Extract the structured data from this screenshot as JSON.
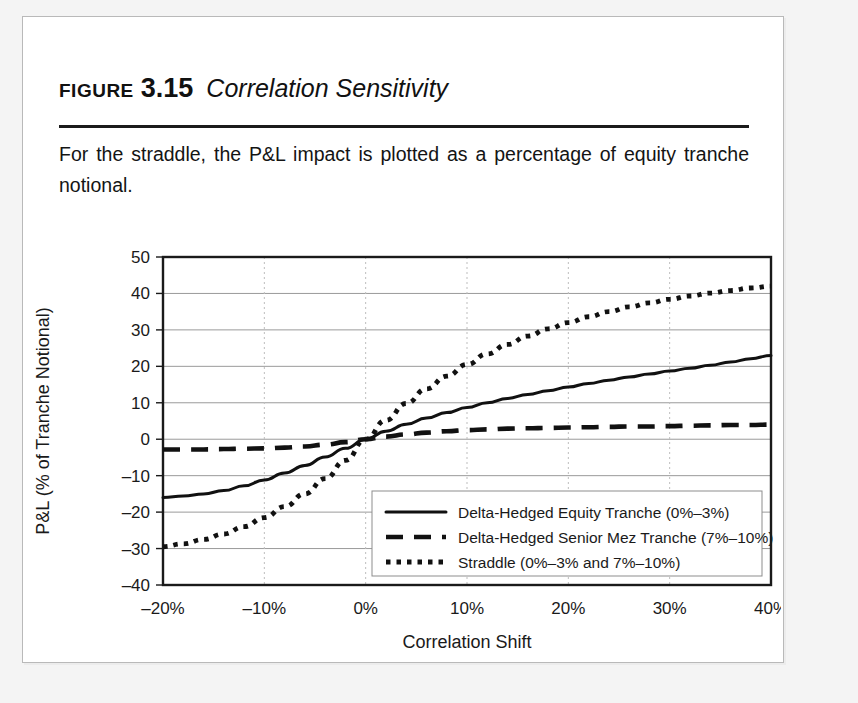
{
  "figure": {
    "label": "FIGURE",
    "number": "3.15",
    "title": "Correlation Sensitivity",
    "caption": "For the straddle, the P&L impact is plotted as a percentage of equity tranche notional."
  },
  "colors": {
    "series_line": "#111111",
    "grid": "#9a9a9a",
    "vertical_grid": "#bdbdbd",
    "frame": "#1a1a1a",
    "card_background": "#ffffff",
    "page_background": "#f4f4f4",
    "text": "#141414"
  },
  "chart_data": {
    "type": "line",
    "title": "",
    "xlabel": "Correlation Shift",
    "ylabel": "P&L (% of Tranche Notional)",
    "xlim": [
      -20,
      40
    ],
    "ylim": [
      -40,
      50
    ],
    "xticks": [
      -20,
      -10,
      0,
      10,
      20,
      30,
      40
    ],
    "xticklabels": [
      "–20%",
      "–10%",
      "0%",
      "10%",
      "20%",
      "30%",
      "40%"
    ],
    "yticks": [
      -40,
      -30,
      -20,
      -10,
      0,
      10,
      20,
      30,
      40,
      50
    ],
    "yticklabels": [
      "–40",
      "–30",
      "–20",
      "–10",
      "0",
      "10",
      "20",
      "30",
      "40",
      "50"
    ],
    "grid": {
      "horizontal": true,
      "vertical": true,
      "vertical_style": "dotted"
    },
    "legend_position": "lower right",
    "x": [
      -20,
      -18,
      -16,
      -14,
      -12,
      -10,
      -8,
      -6,
      -4,
      -2,
      0,
      2,
      4,
      6,
      8,
      10,
      12,
      14,
      16,
      18,
      20,
      22,
      24,
      26,
      28,
      30,
      32,
      34,
      36,
      38,
      40
    ],
    "series": [
      {
        "name": "Delta-Hedged Equity Tranche (0%–3%)",
        "style": "solid",
        "values": [
          -16.0,
          -15.6,
          -15.0,
          -14.1,
          -12.8,
          -11.2,
          -9.3,
          -7.2,
          -4.9,
          -2.5,
          0.0,
          2.2,
          4.1,
          5.8,
          7.3,
          8.7,
          10.0,
          11.2,
          12.3,
          13.3,
          14.3,
          15.3,
          16.2,
          17.1,
          17.9,
          18.7,
          19.5,
          20.3,
          21.2,
          22.1,
          23.0
        ]
      },
      {
        "name": "Delta-Hedged Senior Mez Tranche (7%–10%)",
        "style": "dashed",
        "values": [
          -2.8,
          -2.8,
          -2.8,
          -2.7,
          -2.6,
          -2.5,
          -2.3,
          -2.0,
          -1.5,
          -0.8,
          0.0,
          0.7,
          1.3,
          1.8,
          2.2,
          2.5,
          2.7,
          2.9,
          3.0,
          3.1,
          3.2,
          3.3,
          3.4,
          3.5,
          3.5,
          3.6,
          3.7,
          3.8,
          3.9,
          3.9,
          4.0
        ]
      },
      {
        "name": "Straddle (0%–3% and 7%–10%)",
        "style": "dotted",
        "values": [
          -29.5,
          -28.7,
          -27.5,
          -26.0,
          -24.0,
          -21.5,
          -18.5,
          -15.0,
          -10.8,
          -5.8,
          0.0,
          5.2,
          9.8,
          13.8,
          17.3,
          20.5,
          23.4,
          26.0,
          28.3,
          30.3,
          32.0,
          33.6,
          35.0,
          36.3,
          37.4,
          38.4,
          39.3,
          40.1,
          40.8,
          41.5,
          42.0
        ]
      }
    ]
  },
  "legend": {
    "items": [
      {
        "label": "Delta-Hedged Equity Tranche (0%–3%)",
        "style": "solid"
      },
      {
        "label": "Delta-Hedged Senior Mez Tranche (7%–10%)",
        "style": "dashed"
      },
      {
        "label": "Straddle (0%–3% and 7%–10%)",
        "style": "dotted"
      }
    ]
  }
}
